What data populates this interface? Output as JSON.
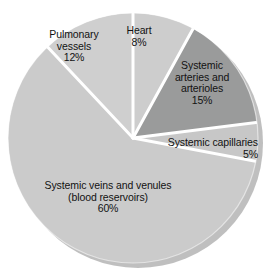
{
  "chart_data": {
    "type": "pie",
    "title_visible": false,
    "xlabel": "",
    "ylabel": "",
    "legend_position": "none",
    "grid": false,
    "total": 100,
    "units": "%",
    "start_angle_deg": 0,
    "direction": "clockwise",
    "categories": [
      "Heart",
      "Systemic arteries and arterioles",
      "Systemic capillaries",
      "Systemic veins and venules (blood reservoirs)",
      "Pulmonary vessels"
    ],
    "values": [
      8,
      15,
      5,
      60,
      12
    ],
    "slices": [
      {
        "name": "heart",
        "label_lines": [
          "Heart"
        ],
        "value_label": "8%",
        "value": 8,
        "color": "#cdcdcd",
        "start_deg": 0,
        "end_deg": 28.8
      },
      {
        "name": "systemic-arteries-and-arterioles",
        "label_lines": [
          "Systemic",
          "arteries and",
          "arterioles"
        ],
        "value_label": "15%",
        "value": 15,
        "color": "#9a9b9b",
        "start_deg": 28.8,
        "end_deg": 82.8
      },
      {
        "name": "systemic-capillaries",
        "label_lines": [
          "Systemic capillaries"
        ],
        "value_label": "5%",
        "value": 5,
        "color": "#c7c7c7",
        "start_deg": 82.8,
        "end_deg": 100.8
      },
      {
        "name": "systemic-veins-and-venules",
        "label_lines": [
          "Systemic veins and venules",
          "(blood reservoirs)"
        ],
        "value_label": "60%",
        "value": 60,
        "color": "#cbcbcb",
        "start_deg": 100.8,
        "end_deg": 316.8
      },
      {
        "name": "pulmonary-vessels",
        "label_lines": [
          "Pulmonary",
          "vessels"
        ],
        "value_label": "12%",
        "value": 12,
        "color": "#cfcfcf",
        "start_deg": 316.8,
        "end_deg": 360
      }
    ]
  },
  "labels": {
    "heart": {
      "line1": "Heart",
      "value": "8%"
    },
    "pulmonary": {
      "line1": "Pulmonary",
      "line2": "vessels",
      "value": "12%"
    },
    "arteries": {
      "line1": "Systemic",
      "line2": "arteries and",
      "line3": "arterioles",
      "value": "15%"
    },
    "capillaries": {
      "line1": "Systemic capillaries",
      "value": "5%"
    },
    "veins": {
      "line1": "Systemic veins and venules",
      "line2": "(blood reservoirs)",
      "value": "60%"
    }
  },
  "colors": {
    "slice_light": "#cdcdcd",
    "slice_dark": "#9a9b9b",
    "separator": "#ffffff",
    "shadow": "#b0b0b0",
    "text": "#121212",
    "background": "#ffffff"
  }
}
